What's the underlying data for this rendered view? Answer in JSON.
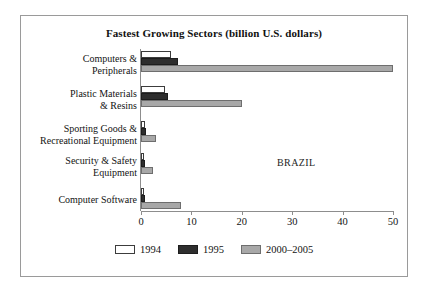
{
  "chart_data": {
    "type": "bar",
    "orientation": "horizontal",
    "title": "Fastest Growing Sectors (billion U.S. dollars)",
    "xlabel": "",
    "ylabel": "",
    "xlim": [
      0,
      50
    ],
    "xticks": [
      0,
      10,
      20,
      30,
      40,
      50
    ],
    "xticklabels": [
      "0",
      "10",
      "20",
      "30",
      "40",
      "50"
    ],
    "grid": false,
    "legend_position": "bottom-center",
    "annotation": "BRAZIL",
    "categories": [
      "Computers &\nPeripherals",
      "Plastic Materials\n& Resins",
      "Sporting Goods &\nRecreational Equipment",
      "Security & Safety\nEquipment",
      "Computer Software"
    ],
    "series": [
      {
        "name": "1994",
        "color": "#ffffff",
        "values": [
          6.0,
          4.7,
          0.7,
          0.6,
          0.6
        ]
      },
      {
        "name": "1995",
        "color": "#2e2e2e",
        "values": [
          7.3,
          5.4,
          1.0,
          0.7,
          0.8
        ]
      },
      {
        "name": "2000–2005",
        "color": "#a8a8a8",
        "values": [
          50.0,
          20.0,
          3.0,
          2.3,
          8.0
        ]
      }
    ]
  }
}
